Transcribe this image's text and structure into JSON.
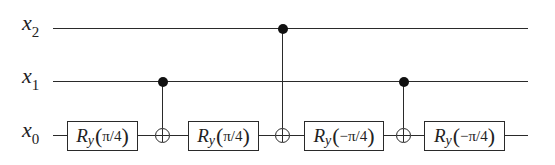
{
  "diagram": {
    "type": "quantum-circuit",
    "qubits": [
      {
        "id": "x2",
        "symbol": "x",
        "index": "2",
        "y": 29
      },
      {
        "id": "x1",
        "symbol": "x",
        "index": "1",
        "y": 82
      },
      {
        "id": "x0",
        "symbol": "x",
        "index": "0",
        "y": 136
      }
    ],
    "wire_start_x": 53,
    "wire_end_x": 528,
    "wire_x0_start_x": 53,
    "gates": [
      {
        "kind": "rotation",
        "name": "R",
        "axis": "y",
        "angle": "π/4",
        "target": "x0",
        "x": 67,
        "width": 71
      },
      {
        "kind": "cnot",
        "control": "x1",
        "target": "x0",
        "x": 163
      },
      {
        "kind": "rotation",
        "name": "R",
        "axis": "y",
        "angle": "π/4",
        "target": "x0",
        "x": 188,
        "width": 71
      },
      {
        "kind": "cnot",
        "control": "x2",
        "target": "x0",
        "x": 283
      },
      {
        "kind": "rotation",
        "name": "R",
        "axis": "y",
        "angle": "−π/4",
        "target": "x0",
        "x": 304,
        "width": 80
      },
      {
        "kind": "cnot",
        "control": "x1",
        "target": "x0",
        "x": 404
      },
      {
        "kind": "rotation",
        "name": "R",
        "axis": "y",
        "angle": "−π/4",
        "target": "x0",
        "x": 424,
        "width": 81
      }
    ],
    "colors": {
      "line": "#2a2a2a",
      "text": "#222222",
      "background": "#ffffff"
    }
  }
}
